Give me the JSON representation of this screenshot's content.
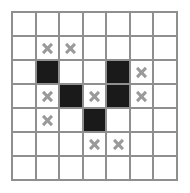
{
  "puzzle": {
    "type": "nonogram-grid",
    "rows": 7,
    "cols": 7,
    "cell_states": [
      [
        "empty",
        "empty",
        "empty",
        "empty",
        "empty",
        "empty",
        "empty"
      ],
      [
        "empty",
        "x",
        "x",
        "empty",
        "empty",
        "empty",
        "empty"
      ],
      [
        "empty",
        "filled",
        "empty",
        "empty",
        "filled",
        "x",
        "empty"
      ],
      [
        "empty",
        "x",
        "filled",
        "x",
        "filled",
        "x",
        "empty"
      ],
      [
        "empty",
        "x",
        "empty",
        "filled",
        "empty",
        "empty",
        "empty"
      ],
      [
        "empty",
        "empty",
        "empty",
        "x",
        "x",
        "empty",
        "empty"
      ],
      [
        "empty",
        "empty",
        "empty",
        "empty",
        "empty",
        "empty",
        "empty"
      ]
    ],
    "colors": {
      "filled": "#1a1a1a",
      "empty": "#ffffff",
      "gridline": "#8f8f8f",
      "mark": "#9a9a9a"
    },
    "mark_glyph": "x-mark-icon",
    "filled_count": 5,
    "marked_count": 9
  }
}
